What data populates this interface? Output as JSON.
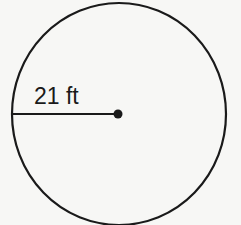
{
  "diagram": {
    "shape": "circle",
    "radius_label": "21 ft",
    "colors": {
      "stroke": "#1a1a1a",
      "background": "#f7f7f5"
    }
  }
}
